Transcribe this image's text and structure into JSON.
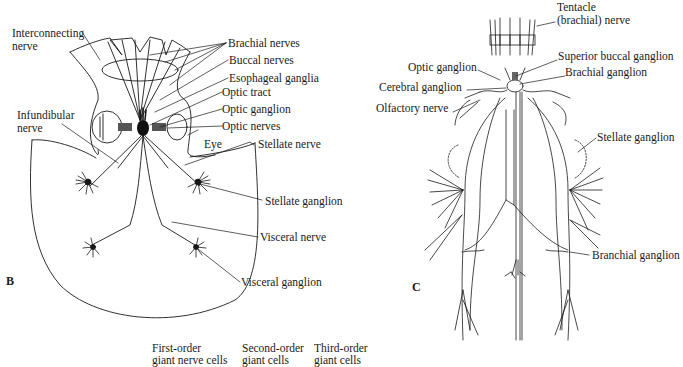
{
  "figure": {
    "panel_b": {
      "letter": "B",
      "labels": {
        "interconnecting_nerve_1": "Interconnecting",
        "interconnecting_nerve_2": "nerve",
        "brachial_nerves": "Brachial nerves",
        "buccal_nerves": "Buccal nerves",
        "esophageal_ganglia": "Esophageal ganglia",
        "optic_tract": "Optic tract",
        "optic_ganglion": "Optic ganglion",
        "optic_nerves": "Optic nerves",
        "infundibular_nerve_1": "Infundibular",
        "infundibular_nerve_2": "nerve",
        "eye": "Eye",
        "stellate_nerve": "Stellate nerve",
        "stellate_ganglion": "Stellate ganglion",
        "visceral_nerve": "Visceral nerve",
        "visceral_ganglion": "Visceral ganglion"
      }
    },
    "panel_c": {
      "letter": "C",
      "labels": {
        "tentacle_nerve_1": "Tentacle",
        "tentacle_nerve_2": "(brachial) nerve",
        "superior_buccal_ganglion": "Superior buccal ganglion",
        "optic_ganglion": "Optic ganglion",
        "brachial_ganglion": "Brachial ganglion",
        "cerebral_ganglion": "Cerebral ganglion",
        "olfactory_nerve": "Olfactory nerve",
        "stellate_ganglion": "Stellate ganglion",
        "branchial_ganglion": "Branchial ganglion"
      }
    },
    "panel_d_partial": {
      "labels": {
        "first_order_1": "First-order",
        "first_order_2": "giant nerve cells",
        "second_order_1": "Second-order",
        "second_order_2": "giant cells",
        "third_order_1": "Third-order",
        "third_order_2": "giant cells"
      }
    }
  },
  "colors": {
    "ink": "#1a1a1a",
    "background": "#ffffff"
  }
}
